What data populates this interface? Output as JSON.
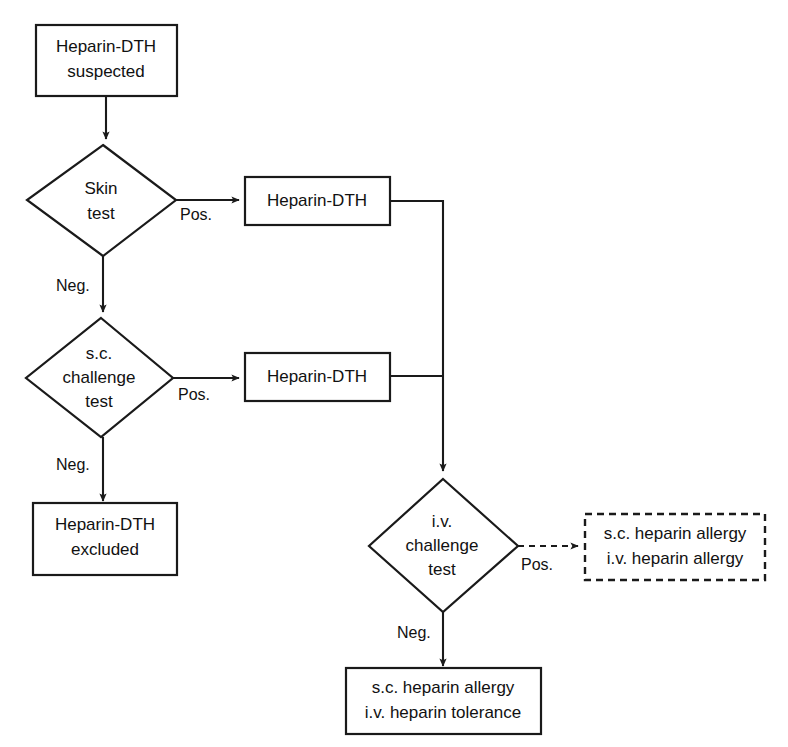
{
  "diagram": {
    "line_color": "#1a1a1a",
    "background_color": "#ffffff",
    "nodes": {
      "start": {
        "line1": "Heparin-DTH",
        "line2": "suspected"
      },
      "skin_test": {
        "line1": "Skin",
        "line2": "test"
      },
      "skin_pos_result": {
        "line1": "Heparin-DTH"
      },
      "sc_challenge": {
        "line1": "s.c.",
        "line2": "challenge",
        "line3": "test"
      },
      "sc_pos_result": {
        "line1": "Heparin-DTH"
      },
      "excluded": {
        "line1": "Heparin-DTH",
        "line2": "excluded"
      },
      "iv_challenge": {
        "line1": "i.v.",
        "line2": "challenge",
        "line3": "test"
      },
      "iv_pos_outcome": {
        "line1": "s.c. heparin allergy",
        "line2": "i.v. heparin allergy"
      },
      "iv_neg_outcome": {
        "line1": "s.c. heparin allergy",
        "line2": "i.v. heparin tolerance"
      }
    },
    "edge_labels": {
      "skin_pos": "Pos.",
      "skin_neg": "Neg.",
      "sc_pos": "Pos.",
      "sc_neg": "Neg.",
      "iv_pos": "Pos.",
      "iv_neg": "Neg."
    }
  }
}
